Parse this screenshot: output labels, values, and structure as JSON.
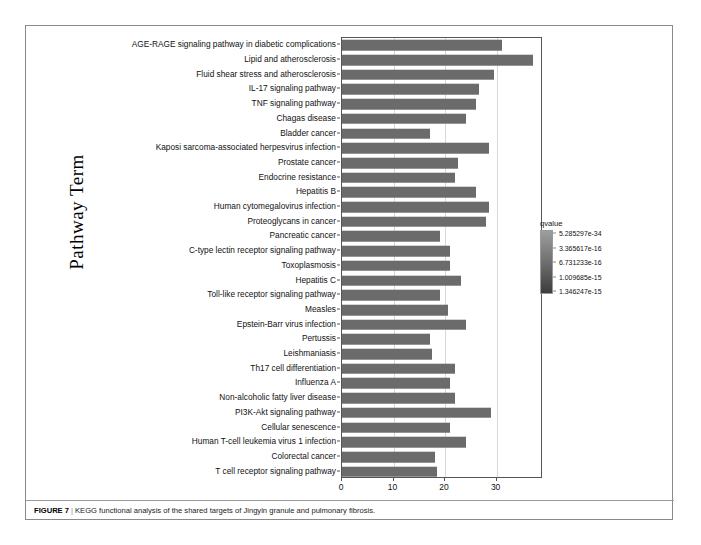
{
  "figure": {
    "caption_label": "FIGURE 7",
    "caption_separator": "|",
    "caption_text": "KEGG functional analysis of the shared targets of Jingyin granule and pulmonary fibrosis."
  },
  "chart_data": {
    "type": "bar",
    "orientation": "horizontal",
    "title": "",
    "xlabel": "",
    "ylabel": "Pathway Term",
    "xlim": [
      0,
      39
    ],
    "xticks": [
      0,
      10,
      20,
      30
    ],
    "xtick_labels": [
      "0",
      "10",
      "20",
      "30"
    ],
    "grid": "vertical",
    "bar_color": "#6b6b6b",
    "categories": [
      "AGE-RAGE signaling pathway in diabetic complications",
      "Lipid and atherosclerosis",
      "Fluid shear stress and atherosclerosis",
      "IL-17 signaling pathway",
      "TNF signaling pathway",
      "Chagas disease",
      "Bladder cancer",
      "Kaposi sarcoma-associated herpesvirus infection",
      "Prostate cancer",
      "Endocrine resistance",
      "Hepatitis B",
      "Human cytomegalovirus infection",
      "Proteoglycans in cancer",
      "Pancreatic cancer",
      "C-type lectin receptor signaling pathway",
      "Toxoplasmosis",
      "Hepatitis C",
      "Toll-like receptor signaling pathway",
      "Measles",
      "Epstein-Barr virus infection",
      "Pertussis",
      "Leishmaniasis",
      "Th17 cell differentiation",
      "Influenza A",
      "Non-alcoholic fatty liver disease",
      "PI3K-Akt signaling pathway",
      "Cellular senescence",
      "Human T-cell leukemia virus 1 infection",
      "Colorectal cancer",
      "T cell receptor signaling pathway"
    ],
    "values": [
      31,
      37,
      29.5,
      26.5,
      26,
      24,
      17,
      28.5,
      22.5,
      22,
      26,
      28.5,
      28,
      19,
      21,
      21,
      23,
      19,
      20.5,
      24,
      17,
      17.5,
      22,
      21,
      22,
      29,
      21,
      24,
      18,
      18.5
    ]
  },
  "legend": {
    "title": "qvalue",
    "entries": [
      "5.285297e-34",
      "3.365617e-16",
      "6.731233e-16",
      "1.009685e-15",
      "1.346247e-15"
    ],
    "gradient_top_color": "#9e9e9e",
    "gradient_bottom_color": "#3d3d3d"
  }
}
